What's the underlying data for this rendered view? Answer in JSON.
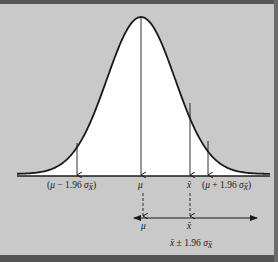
{
  "figure": {
    "type": "normal-distribution-confidence-interval-diagram",
    "colors": {
      "background": "#c9c9c9",
      "curve_fill": "#ffffff",
      "line": "#1a1a1a",
      "border": "#555555"
    },
    "axis_labels": {
      "lower_bound": "(μ − 1.96 σx̄)",
      "lower_bound_parts": {
        "open": "(",
        "mu": "μ",
        "minus": " − 1.96 ",
        "sigma": "σ",
        "sub": "x̄",
        "close": ")"
      },
      "mean": "μ",
      "sample_mean": "x̄",
      "upper_bound": "(μ + 1.96 σx̄)",
      "upper_bound_parts": {
        "open": "(",
        "mu": "μ",
        "plus": " + 1.96 ",
        "sigma": "σ",
        "sub": "x̄",
        "close": ")"
      }
    },
    "interval": {
      "mu_label": "μ",
      "xbar_label": "x̄",
      "caption": "x̄ ± 1.96 σx̄",
      "caption_parts": {
        "xbar": "x̄",
        "pm": " ± 1.96 ",
        "sigma": "σ",
        "sub": "x̄"
      }
    }
  }
}
